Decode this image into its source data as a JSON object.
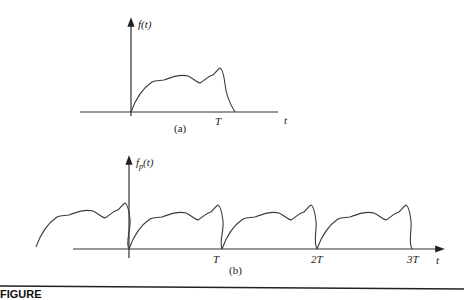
{
  "figure": {
    "panel_a": {
      "y_label": "f(t)",
      "x_label": "t",
      "tick_T": "T",
      "sublabel": "(a)"
    },
    "panel_b": {
      "y_label_main": "f",
      "y_label_sub": "p",
      "y_label_rest": "(t)",
      "x_label": "t",
      "ticks": [
        "T",
        "2T",
        "3T"
      ],
      "sublabel": "(b)"
    },
    "caption_clipped": "FIGURE"
  },
  "colors": {
    "line": "#3a3a3a",
    "axis": "#333333",
    "rule": "#222222"
  }
}
